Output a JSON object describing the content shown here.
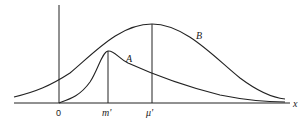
{
  "diagram": {
    "axis": {
      "x_label": "x",
      "origin_label": "0"
    },
    "curves": [
      {
        "name": "A",
        "label": "A",
        "shape": "right-skewed, peak at m'"
      },
      {
        "name": "B",
        "label": "B",
        "shape": "symmetric bell, peak at μ'"
      }
    ],
    "markers": [
      {
        "name": "m-prime",
        "label": "m'"
      },
      {
        "name": "mu-prime",
        "label": "μ'"
      }
    ],
    "colors": {
      "line": "#222222",
      "background": "#ffffff"
    }
  }
}
